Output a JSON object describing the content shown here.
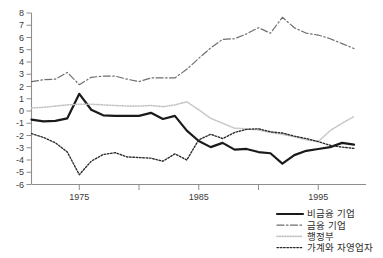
{
  "chart_data": {
    "type": "line",
    "title": "",
    "subtitle": "",
    "xlabel": "",
    "ylabel": "",
    "xlim": [
      1971,
      1999
    ],
    "ylim": [
      -6,
      8
    ],
    "grid": false,
    "legend_position": "bottom-right",
    "y_ticks": [
      8,
      7,
      6,
      5,
      4,
      3,
      2,
      1,
      0,
      -1,
      -2,
      -3,
      -4,
      -5,
      -6
    ],
    "y_tick_labels": [
      "8",
      "7",
      "6",
      "5",
      "4",
      "3",
      "2",
      "1",
      "0",
      "-1",
      "-2",
      "-3",
      "-4",
      "-5",
      "-6"
    ],
    "x_ticks": [
      1975,
      1980,
      1985,
      1990,
      1995
    ],
    "x_tick_labels": [
      "1975",
      "",
      "1985",
      "",
      "1995"
    ],
    "x": [
      1971,
      1972,
      1973,
      1974,
      1975,
      1976,
      1977,
      1978,
      1979,
      1980,
      1981,
      1982,
      1983,
      1984,
      1985,
      1986,
      1987,
      1988,
      1989,
      1990,
      1991,
      1992,
      1993,
      1994,
      1995,
      1996,
      1997,
      1998
    ],
    "series": [
      {
        "name": "비금융 기업",
        "style": "solid",
        "color": "#1a1a1a",
        "width": 2.2,
        "values": [
          -0.7,
          -0.85,
          -0.8,
          -0.6,
          1.4,
          0.1,
          -0.35,
          -0.4,
          -0.4,
          -0.4,
          -0.15,
          -0.65,
          -0.4,
          -1.6,
          -2.45,
          -2.95,
          -2.6,
          -3.15,
          -3.1,
          -3.35,
          -3.45,
          -4.3,
          -3.6,
          -3.25,
          -3.1,
          -2.95,
          -2.6,
          -2.75
        ]
      },
      {
        "name": "금융 기업",
        "style": "dashdot",
        "color": "#6e6e6e",
        "width": 1.2,
        "values": [
          2.4,
          2.55,
          2.6,
          3.15,
          2.15,
          2.75,
          2.85,
          2.85,
          2.6,
          2.4,
          2.7,
          2.7,
          2.7,
          3.4,
          4.3,
          5.15,
          5.85,
          5.9,
          6.3,
          6.8,
          6.35,
          7.65,
          6.8,
          6.35,
          6.2,
          5.9,
          5.5,
          5.1
        ]
      },
      {
        "name": "행정부",
        "style": "fine-dot",
        "color": "#c4c4c4",
        "width": 1.6,
        "values": [
          0.25,
          0.3,
          0.4,
          0.5,
          0.55,
          0.55,
          0.5,
          0.45,
          0.4,
          0.4,
          0.45,
          0.35,
          0.5,
          0.75,
          0.1,
          -0.6,
          -1.0,
          -1.4,
          -1.45,
          -1.55,
          -1.75,
          -1.9,
          -2.1,
          -2.35,
          -2.5,
          -1.6,
          -1.0,
          -0.45
        ]
      },
      {
        "name": "가계와 자영업자",
        "style": "dotted",
        "color": "#2b2b2b",
        "width": 1.4,
        "values": [
          -1.85,
          -2.15,
          -2.6,
          -3.35,
          -5.2,
          -4.1,
          -3.55,
          -3.4,
          -3.75,
          -3.8,
          -3.85,
          -4.1,
          -3.5,
          -4.0,
          -2.35,
          -1.9,
          -2.25,
          -1.75,
          -1.5,
          -1.45,
          -1.7,
          -1.8,
          -2.05,
          -2.25,
          -2.5,
          -2.8,
          -2.95,
          -3.05
        ]
      }
    ]
  },
  "legend": {
    "items": [
      {
        "label": "비금융 기업",
        "marker": "solid-line-marker"
      },
      {
        "label": "금융 기업",
        "marker": "dashdot-line-marker"
      },
      {
        "label": "행정부",
        "marker": "fine-dot-line-marker"
      },
      {
        "label": "가계와 자영업자",
        "marker": "dotted-line-marker"
      }
    ]
  }
}
